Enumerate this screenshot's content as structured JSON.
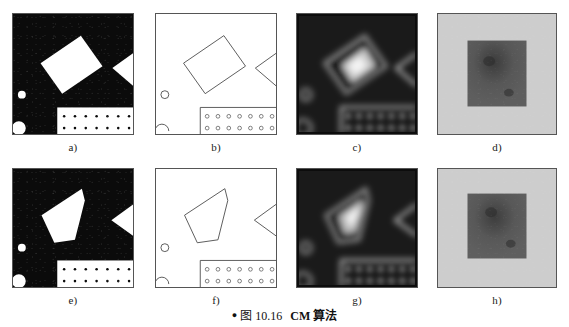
{
  "figure": {
    "caption": {
      "bullet": "●",
      "figure_number": "图 10.16",
      "title": "CM 算法"
    },
    "colors": {
      "binary_background": "#0b0b0b",
      "binary_foreground": "#ffffff",
      "line_art_background": "#ffffff",
      "line_art_stroke": "#4a4a4a",
      "panel_border": "#555555",
      "distance_map_dark": "#141414",
      "distance_map_light": "#f2f2f2",
      "gray_field": "#c9c9c9",
      "gray_inner": "#4e4e4e",
      "label_text": "#1a1a1a"
    },
    "panels": [
      {
        "id": "a",
        "label": "a)",
        "kind": "binary-image",
        "description": "原始二值图像 - 白色矩形、三角形、圆点及点阵矩形",
        "row": 1,
        "column": 1
      },
      {
        "id": "b",
        "label": "b)",
        "kind": "line-art",
        "description": "轮廓线描图",
        "row": 1,
        "column": 2
      },
      {
        "id": "c",
        "label": "c)",
        "kind": "distance-map",
        "description": "距离变换灰度图",
        "row": 1,
        "column": 3
      },
      {
        "id": "d",
        "label": "d)",
        "kind": "gray-field",
        "description": "灰度方块结果图",
        "row": 1,
        "column": 4
      },
      {
        "id": "e",
        "label": "e)",
        "kind": "binary-image",
        "description": "原始二值图像 - 五边形变形",
        "row": 2,
        "column": 1
      },
      {
        "id": "f",
        "label": "f)",
        "kind": "line-art",
        "description": "轮廓线描图 - 五边形",
        "row": 2,
        "column": 2
      },
      {
        "id": "g",
        "label": "g)",
        "kind": "distance-map",
        "description": "距离变换灰度图",
        "row": 2,
        "column": 3
      },
      {
        "id": "h",
        "label": "h)",
        "kind": "gray-field",
        "description": "灰度方块结果图",
        "row": 2,
        "column": 4
      }
    ]
  }
}
